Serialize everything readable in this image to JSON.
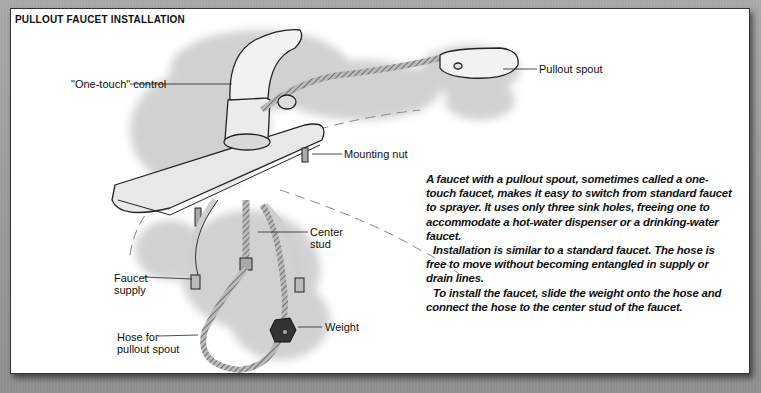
{
  "figure": {
    "title": "Pullout Faucet Installation",
    "labels": {
      "control": "\"One-touch\" control",
      "spout": "Pullout spout",
      "mounting_nut": "Mounting nut",
      "center_stud_1": "Center",
      "center_stud_2": "stud",
      "supply_1": "Faucet",
      "supply_2": "supply",
      "weight": "Weight",
      "hose_1": "Hose for",
      "hose_2": "pullout spout"
    }
  },
  "text": {
    "paragraphs": [
      "A faucet with a pullout spout, sometimes called a one-touch faucet, makes it easy to switch from standard faucet to sprayer. It uses only three sink holes, freeing one to accommodate a hot-water dispenser or a drinking-water faucet.",
      "Installation is similar to a standard faucet. The hose is free to move without becoming entangled in supply or drain lines.",
      "To install the faucet, slide the weight onto the hose and connect the hose to the center stud of the faucet."
    ]
  }
}
